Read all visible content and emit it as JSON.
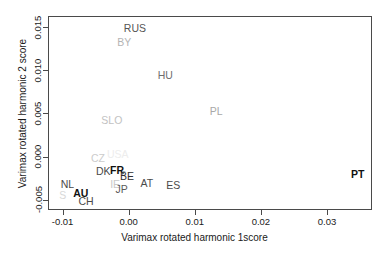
{
  "chart_data": {
    "type": "scatter",
    "title": "",
    "xlabel": "Varimax rotated harmonic 1score",
    "ylabel": "Varimax rotated harmonic 2 score",
    "xlim": [
      -0.0122,
      0.0368
    ],
    "ylim": [
      -0.0062,
      0.0163
    ],
    "grid": false,
    "legend": "none",
    "xticks": [
      "-0.01",
      "0.00",
      "0.01",
      "0.02",
      "0.03"
    ],
    "xtickvalues": [
      -0.01,
      0.0,
      0.01,
      0.02,
      0.03
    ],
    "yticks": [
      "-0.005",
      "0.000",
      "0.005",
      "0.010",
      "0.015"
    ],
    "ytickvalues": [
      -0.005,
      0.0,
      0.005,
      0.01,
      0.015
    ],
    "marker_style": "text-label",
    "points": [
      {
        "label": "RUS",
        "x": 0.0008,
        "y": 0.01505,
        "color": "#555555",
        "size": 10.5,
        "weight": "normal"
      },
      {
        "label": "BY",
        "x": -0.0008,
        "y": 0.01345,
        "color": "#b4b4b4",
        "size": 10.5,
        "weight": "normal"
      },
      {
        "label": "HU",
        "x": 0.0054,
        "y": 0.00955,
        "color": "#6e6e6e",
        "size": 10.5,
        "weight": "normal"
      },
      {
        "label": "PL",
        "x": 0.0131,
        "y": 0.00545,
        "color": "#a8a8a8",
        "size": 10.5,
        "weight": "normal"
      },
      {
        "label": "SLO",
        "x": -0.0027,
        "y": 0.0044,
        "color": "#c2c2c2",
        "size": 10.5,
        "weight": "normal"
      },
      {
        "label": "USA",
        "x": -0.0018,
        "y": 0.00045,
        "color": "#ededed",
        "size": 10.5,
        "weight": "normal"
      },
      {
        "label": "CZ",
        "x": -0.0048,
        "y": -0.0001,
        "color": "#cccccc",
        "size": 10.5,
        "weight": "normal"
      },
      {
        "label": "DK",
        "x": -0.004,
        "y": -0.00155,
        "color": "#4a4a4a",
        "size": 10.5,
        "weight": "normal"
      },
      {
        "label": "FR",
        "x": -0.0019,
        "y": -0.0015,
        "color": "#111111",
        "size": 10.5,
        "weight": "bold"
      },
      {
        "label": "c",
        "x": -0.0009,
        "y": -0.00175,
        "color": "#9a9a9a",
        "size": 9,
        "weight": "normal"
      },
      {
        "label": "BE",
        "x": -0.0004,
        "y": -0.00215,
        "color": "#2e2e2e",
        "size": 10.5,
        "weight": "normal"
      },
      {
        "label": "AT",
        "x": 0.0026,
        "y": -0.0029,
        "color": "#4a4a4a",
        "size": 10.5,
        "weight": "normal"
      },
      {
        "label": "ES",
        "x": 0.0066,
        "y": -0.0032,
        "color": "#4a4a4a",
        "size": 10.5,
        "weight": "normal"
      },
      {
        "label": "PT",
        "x": 0.0345,
        "y": -0.00195,
        "color": "#111111",
        "size": 10.5,
        "weight": "bold"
      },
      {
        "label": "NL",
        "x": -0.0094,
        "y": -0.0031,
        "color": "#4a4a4a",
        "size": 10.5,
        "weight": "normal"
      },
      {
        "label": "IE",
        "x": -0.0022,
        "y": -0.00305,
        "color": "#c8c8c8",
        "size": 10.5,
        "weight": "normal"
      },
      {
        "label": "JP",
        "x": -0.0012,
        "y": -0.00365,
        "color": "#5a5a5a",
        "size": 10.5,
        "weight": "normal"
      },
      {
        "label": "S",
        "x": -0.0101,
        "y": -0.0043,
        "color": "#d8d8d8",
        "size": 10.5,
        "weight": "normal"
      },
      {
        "label": "AU",
        "x": -0.0074,
        "y": -0.00415,
        "color": "#111111",
        "size": 10.5,
        "weight": "bold"
      },
      {
        "label": "CH",
        "x": -0.0066,
        "y": -0.005,
        "color": "#4a4a4a",
        "size": 10.5,
        "weight": "normal"
      }
    ]
  }
}
